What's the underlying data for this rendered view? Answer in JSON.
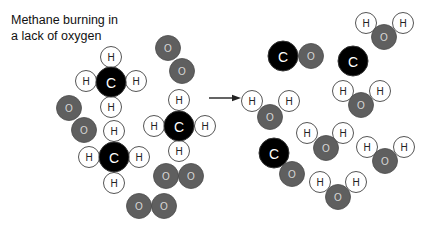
{
  "title": {
    "line1": "Methane burning in",
    "line2": "a lack of oxygen"
  },
  "colors": {
    "carbon": "#000000",
    "oxygen": "#5f5f5f",
    "hydrogen_fill": "#ffffff",
    "hydrogen_stroke": "#555555",
    "carbon_label": "#ffffff",
    "oxygen_label": "#d8d8d8",
    "hydrogen_label": "#222222",
    "arrow": "#222222"
  },
  "radii": {
    "C": 15,
    "O": 12.5,
    "H": 10.5
  },
  "arrow": {
    "x1": 209,
    "y1": 98,
    "x2": 241,
    "y2": 98
  },
  "reactants": {
    "label": "reactants",
    "molecules": [
      {
        "type": "methane",
        "atoms": [
          {
            "el": "H",
            "label": "H",
            "x": 111,
            "y": 57
          },
          {
            "el": "H",
            "label": "H",
            "x": 86,
            "y": 81
          },
          {
            "el": "H",
            "label": "H",
            "x": 136,
            "y": 81
          },
          {
            "el": "H",
            "label": "H",
            "x": 111,
            "y": 107
          },
          {
            "el": "C",
            "label": "C",
            "x": 111,
            "y": 82
          }
        ]
      },
      {
        "type": "methane",
        "atoms": [
          {
            "el": "H",
            "label": "H",
            "x": 179,
            "y": 100
          },
          {
            "el": "H",
            "label": "H",
            "x": 154,
            "y": 126
          },
          {
            "el": "H",
            "label": "H",
            "x": 205,
            "y": 126
          },
          {
            "el": "H",
            "label": "H",
            "x": 179,
            "y": 151
          },
          {
            "el": "C",
            "label": "C",
            "x": 179,
            "y": 126
          }
        ]
      },
      {
        "type": "methane",
        "atoms": [
          {
            "el": "H",
            "label": "H",
            "x": 114,
            "y": 131
          },
          {
            "el": "H",
            "label": "H",
            "x": 89,
            "y": 157
          },
          {
            "el": "H",
            "label": "H",
            "x": 139,
            "y": 157
          },
          {
            "el": "H",
            "label": "H",
            "x": 114,
            "y": 183
          },
          {
            "el": "C",
            "label": "C",
            "x": 114,
            "y": 157
          }
        ]
      },
      {
        "type": "oxygen",
        "atoms": [
          {
            "el": "O",
            "label": "O",
            "x": 168,
            "y": 48
          },
          {
            "el": "O",
            "label": "O",
            "x": 182,
            "y": 71
          }
        ]
      },
      {
        "type": "oxygen",
        "atoms": [
          {
            "el": "O",
            "label": "O",
            "x": 69,
            "y": 108
          },
          {
            "el": "O",
            "label": "O",
            "x": 84,
            "y": 130
          }
        ]
      },
      {
        "type": "oxygen",
        "atoms": [
          {
            "el": "O",
            "label": "O",
            "x": 166,
            "y": 176
          },
          {
            "el": "O",
            "label": "O",
            "x": 191,
            "y": 176
          }
        ]
      },
      {
        "type": "oxygen",
        "atoms": [
          {
            "el": "O",
            "label": "O",
            "x": 139,
            "y": 206
          },
          {
            "el": "O",
            "label": "O",
            "x": 164,
            "y": 206
          }
        ]
      }
    ]
  },
  "products": {
    "label": "products",
    "molecules": [
      {
        "type": "carbon-monoxide",
        "atoms": [
          {
            "el": "C",
            "label": "C",
            "x": 283,
            "y": 56
          },
          {
            "el": "O",
            "label": "O",
            "x": 311,
            "y": 56
          }
        ]
      },
      {
        "type": "carbon",
        "atoms": [
          {
            "el": "C",
            "label": "C",
            "x": 353,
            "y": 61
          }
        ]
      },
      {
        "type": "carbon-monoxide",
        "atoms": [
          {
            "el": "C",
            "label": "C",
            "x": 274,
            "y": 153
          },
          {
            "el": "O",
            "label": "O",
            "x": 292,
            "y": 174
          }
        ]
      },
      {
        "type": "water",
        "atoms": [
          {
            "el": "H",
            "label": "H",
            "x": 366,
            "y": 23
          },
          {
            "el": "H",
            "label": "H",
            "x": 403,
            "y": 23
          },
          {
            "el": "O",
            "label": "O",
            "x": 384,
            "y": 37
          }
        ]
      },
      {
        "type": "water",
        "atoms": [
          {
            "el": "H",
            "label": "H",
            "x": 252,
            "y": 101
          },
          {
            "el": "H",
            "label": "H",
            "x": 289,
            "y": 101
          },
          {
            "el": "O",
            "label": "O",
            "x": 270,
            "y": 117
          }
        ]
      },
      {
        "type": "water",
        "atoms": [
          {
            "el": "H",
            "label": "H",
            "x": 343,
            "y": 91
          },
          {
            "el": "H",
            "label": "H",
            "x": 380,
            "y": 91
          },
          {
            "el": "O",
            "label": "O",
            "x": 361,
            "y": 105
          }
        ]
      },
      {
        "type": "water",
        "atoms": [
          {
            "el": "H",
            "label": "H",
            "x": 307,
            "y": 133
          },
          {
            "el": "H",
            "label": "H",
            "x": 343,
            "y": 133
          },
          {
            "el": "O",
            "label": "O",
            "x": 326,
            "y": 148
          }
        ]
      },
      {
        "type": "water",
        "atoms": [
          {
            "el": "H",
            "label": "H",
            "x": 367,
            "y": 147
          },
          {
            "el": "H",
            "label": "H",
            "x": 404,
            "y": 147
          },
          {
            "el": "O",
            "label": "O",
            "x": 385,
            "y": 161
          }
        ]
      },
      {
        "type": "water",
        "atoms": [
          {
            "el": "H",
            "label": "H",
            "x": 320,
            "y": 182
          },
          {
            "el": "H",
            "label": "H",
            "x": 356,
            "y": 182
          },
          {
            "el": "O",
            "label": "O",
            "x": 338,
            "y": 197
          }
        ]
      }
    ]
  }
}
